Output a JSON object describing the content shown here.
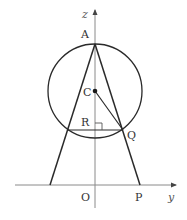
{
  "diagram": {
    "type": "geometry-figure",
    "colors": {
      "line": "#2a2a2a",
      "axis": "#7a7a7a",
      "label": "#333333"
    },
    "axes": {
      "vertical": {
        "label": "z"
      },
      "horizontal": {
        "label": "y"
      },
      "origin": {
        "label": "O"
      }
    },
    "points": {
      "A": {
        "label": "A"
      },
      "C": {
        "label": "C"
      },
      "R": {
        "label": "R"
      },
      "Q": {
        "label": "Q"
      },
      "P": {
        "label": "P"
      }
    },
    "shapes": {
      "circle": {
        "center": "C",
        "passes_through": [
          "A",
          "Q"
        ]
      },
      "segments": [
        "A-P",
        "A-(left base)",
        "C-Q",
        "R-Q (horizontal chord)"
      ],
      "right_angle_marker": "at R"
    }
  }
}
